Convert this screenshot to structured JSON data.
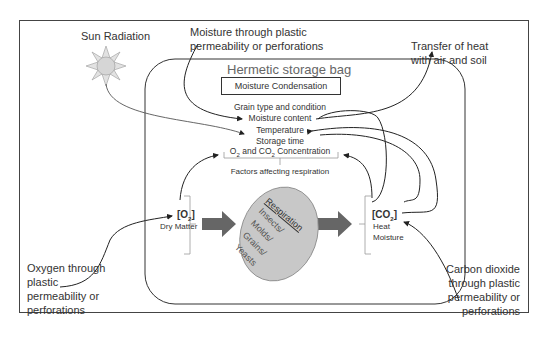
{
  "diagram": {
    "bag_title": "Hermetic storage bag",
    "moisture_condensation": "Moisture Condensation",
    "factors": [
      "Grain type and condition",
      "Moisture content",
      "Temperature",
      "Storage time"
    ],
    "gas_concentration": {
      "o2": "O",
      "and": "and CO",
      "concentration": "Concentration",
      "sub": "2"
    },
    "factors_affecting": "Factors affecting respiration",
    "respiration_label": "Respiration",
    "organisms": [
      "Insects/",
      "Molds/",
      "Grains/",
      "Yeasts"
    ],
    "inputs": {
      "o2": "[O",
      "o2_close": "]",
      "sub": "2",
      "dry_matter": "Dry Matter"
    },
    "outputs": {
      "co2": "[CO",
      "co2_close": "]",
      "sub": "2",
      "heat": "Heat",
      "moisture": "Moisture"
    },
    "external": {
      "sun": "Sun Radiation",
      "moisture_line1": "Moisture through plastic",
      "moisture_line2": "permeability or perforations",
      "heat_line1": "Transfer of heat",
      "heat_line2": "with air and soil",
      "oxygen": [
        "Oxygen through",
        "plastic",
        "permeability or",
        "perforations"
      ],
      "co2": [
        "Carbon dioxide",
        "through plastic",
        "permeability or",
        "perforations"
      ]
    },
    "colors": {
      "ellipse_fill": "#c8c8c8",
      "arrow_fill": "#666666",
      "sun_fill": "#d9d9d9",
      "bag_border": "#444444"
    }
  }
}
